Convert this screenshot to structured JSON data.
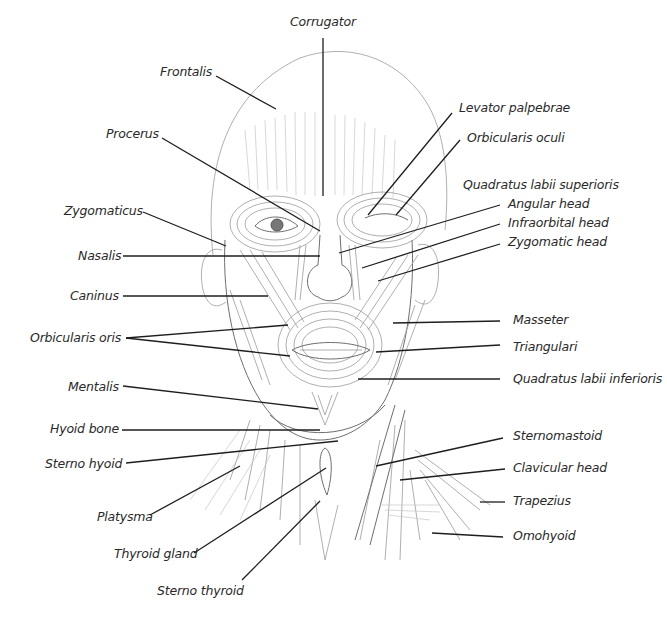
{
  "diagram": {
    "labels": {
      "corrugator": "Corrugator",
      "frontalis": "Frontalis",
      "procerus": "Procerus",
      "levator_palpebrae": "Levator palpebrae",
      "orbicularis_oculi": "Orbicularis oculi",
      "quadratus_labii_superioris": "Quadratus labii superioris",
      "angular_head": "Angular head",
      "infraorbital_head": "Infraorbital head",
      "zygomatic_head": "Zygomatic head",
      "zygomaticus": "Zygomaticus",
      "nasalis": "Nasalis",
      "caninus": "Caninus",
      "orbicularis_oris": "Orbicularis oris",
      "masseter": "Masseter",
      "triangulari": "Triangulari",
      "quadratus_labii_inferioris": "Quadratus labii inferioris",
      "mentalis": "Mentalis",
      "hyoid_bone": "Hyoid bone",
      "sterno_hyoid": "Sterno hyoid",
      "sternomastoid": "Sternomastoid",
      "clavicular_head": "Clavicular head",
      "trapezius": "Trapezius",
      "platysma": "Platysma",
      "omohyoid": "Omohyoid",
      "thyroid_gland": "Thyroid gland",
      "sterno_thyroid": "Sterno thyroid"
    }
  }
}
